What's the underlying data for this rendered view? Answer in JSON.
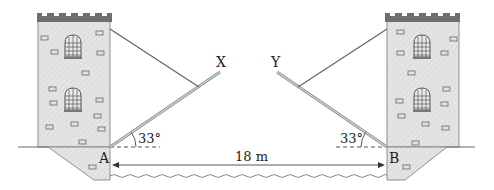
{
  "diagram": {
    "type": "drawbridge-geometry",
    "labels": {
      "point_a": "A",
      "point_b": "B",
      "end_x": "X",
      "end_y": "Y",
      "angle_left": "33°",
      "angle_right": "33°",
      "distance": "18 m"
    },
    "values": {
      "angle_deg": 33,
      "span_m": 18
    },
    "colors": {
      "tower_fill": "#e6e6e6",
      "tower_top": "#6e6e6e",
      "line": "#555555",
      "bridge": "#b8b8b8",
      "water": "#888888"
    }
  }
}
